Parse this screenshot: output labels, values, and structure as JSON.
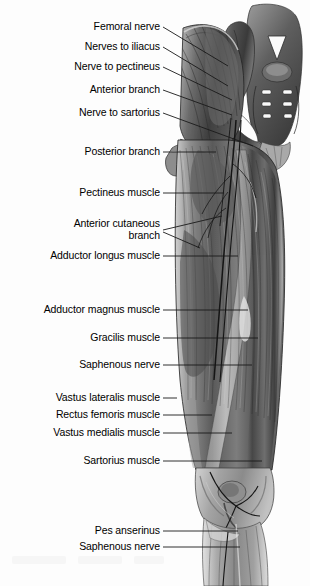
{
  "figure": {
    "orientation": "anterior view, right lower limb",
    "style": "grayscale anatomical illustration",
    "background_color": "#fdfdfd",
    "label_color": "#000000",
    "leader_line_color": "#1a1a1a"
  },
  "labels": [
    {
      "id": "femoral-nerve",
      "text": "Femoral nerve",
      "right": 160,
      "top": 21,
      "leader": "M163,27 L228,66"
    },
    {
      "id": "nerves-to-iliacus",
      "text": "Nerves to iliacus",
      "right": 160,
      "top": 41,
      "leader": "M163,47 L228,86"
    },
    {
      "id": "nerve-to-pectineus",
      "text": "Nerve to pectineus",
      "right": 160,
      "top": 61,
      "leader": "M163,67 L232,100"
    },
    {
      "id": "anterior-branch",
      "text": "Anterior branch",
      "right": 160,
      "top": 84,
      "leader": "M163,90 L232,115"
    },
    {
      "id": "nerve-to-sartorius",
      "text": "Nerve to sartorius",
      "right": 160,
      "top": 107,
      "leader": "M163,113 L253,146"
    },
    {
      "id": "posterior-branch",
      "text": "Posterior branch",
      "right": 160,
      "top": 146,
      "leader": "M163,152 L216,152"
    },
    {
      "id": "pectineus-muscle",
      "text": "Pectineus muscle",
      "right": 160,
      "top": 187,
      "leader": "M163,193 L224,193"
    },
    {
      "id": "anterior-cutaneous-branch",
      "text": "Anterior cutaneous\nbranch",
      "right": 160,
      "top": 218,
      "leader": "M163,230 L222,216 M163,232 L200,248"
    },
    {
      "id": "adductor-longus-muscle",
      "text": "Adductor longus muscle",
      "right": 160,
      "top": 250,
      "leader": "M163,256 L238,256"
    },
    {
      "id": "adductor-magnus-muscle",
      "text": "Adductor magnus muscle",
      "right": 160,
      "top": 304,
      "leader": "M163,310 L248,310"
    },
    {
      "id": "gracilis-muscle",
      "text": "Gracilis muscle",
      "right": 160,
      "top": 332,
      "leader": "M163,338 L258,338"
    },
    {
      "id": "saphenous-nerve-thigh",
      "text": "Saphenous nerve",
      "right": 160,
      "top": 359,
      "leader": "M163,365 L252,365"
    },
    {
      "id": "vastus-lateralis-muscle",
      "text": "Vastus lateralis muscle",
      "right": 160,
      "top": 392,
      "leader": "M163,398 L177,398"
    },
    {
      "id": "rectus-femoris-muscle",
      "text": "Rectus femoris muscle",
      "right": 160,
      "top": 409,
      "leader": "M163,415 L212,415"
    },
    {
      "id": "vastus-medialis-muscle",
      "text": "Vastus medialis muscle",
      "right": 160,
      "top": 427,
      "leader": "M163,433 L232,433"
    },
    {
      "id": "sartorius-muscle",
      "text": "Sartorius muscle",
      "right": 160,
      "top": 455,
      "leader": "M163,461 L262,461"
    },
    {
      "id": "pes-anserinus",
      "text": "Pes anserinus",
      "right": 160,
      "top": 525,
      "leader": "M163,531 L238,531"
    },
    {
      "id": "saphenous-nerve-leg",
      "text": "Saphenous nerve",
      "right": 160,
      "top": 541,
      "leader": "M163,547 L240,547"
    }
  ],
  "structures": [
    {
      "name": "iliac crest / ilium"
    },
    {
      "name": "sacrum with vertebral foramina"
    },
    {
      "name": "psoas major and iliacus muscles"
    },
    {
      "name": "inguinal ligament"
    },
    {
      "name": "pectineus muscle"
    },
    {
      "name": "adductor longus muscle"
    },
    {
      "name": "adductor magnus muscle"
    },
    {
      "name": "gracilis muscle"
    },
    {
      "name": "sartorius muscle"
    },
    {
      "name": "rectus femoris muscle"
    },
    {
      "name": "vastus lateralis muscle"
    },
    {
      "name": "vastus medialis muscle"
    },
    {
      "name": "patella and knee joint"
    },
    {
      "name": "pes anserinus tendon insertion"
    },
    {
      "name": "tibia and fibula shafts"
    }
  ]
}
